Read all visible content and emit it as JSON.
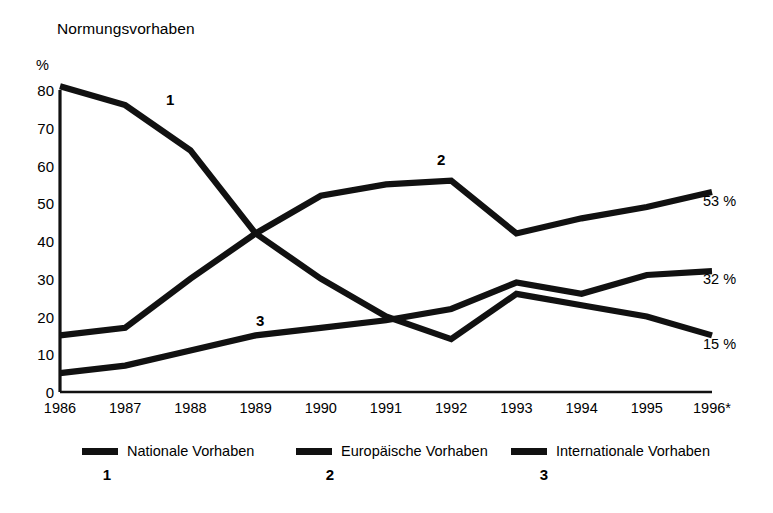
{
  "chart_data": {
    "type": "line",
    "title": "Normungsvorhaben",
    "xlabel": "",
    "ylabel": "%",
    "ylim": [
      0,
      80
    ],
    "yticks": [
      0,
      10,
      20,
      30,
      40,
      50,
      60,
      70,
      80
    ],
    "grid": false,
    "legend_position": "bottom",
    "categories": [
      "1986",
      "1987",
      "1988",
      "1989",
      "1990",
      "1991",
      "1992",
      "1993",
      "1994",
      "1995",
      "1996*"
    ],
    "series": [
      {
        "name": "Nationale Vorhaben",
        "key": "1",
        "values": [
          81,
          76,
          64,
          42,
          30,
          20,
          14,
          26,
          23,
          20,
          15
        ],
        "end_label": "15 %",
        "annotation": "1"
      },
      {
        "name": "Europäische Vorhaben",
        "key": "2",
        "values": [
          15,
          17,
          30,
          42,
          52,
          55,
          56,
          42,
          46,
          49,
          53
        ],
        "end_label": "53 %",
        "annotation": "2"
      },
      {
        "name": "Internationale Vorhaben",
        "key": "3",
        "values": [
          5,
          7,
          11,
          15,
          17,
          19,
          22,
          29,
          26,
          31,
          32
        ],
        "end_label": "32 %",
        "annotation": "3"
      }
    ],
    "annotations": [
      {
        "text": "1",
        "x": 166,
        "y": 92
      },
      {
        "text": "2",
        "x": 437,
        "y": 152
      },
      {
        "text": "3",
        "x": 256,
        "y": 313
      }
    ],
    "end_labels": [
      {
        "text": "53 %",
        "x": 703,
        "y": 194
      },
      {
        "text": "32 %",
        "x": 703,
        "y": 272
      },
      {
        "text": "15 %",
        "x": 703,
        "y": 337
      }
    ]
  },
  "legend": {
    "items": [
      {
        "label": "Nationale Vorhaben",
        "number": "1",
        "x": 82,
        "number_x": 107
      },
      {
        "label": "Europäische Vorhaben",
        "number": "2",
        "x": 296,
        "number_x": 330
      },
      {
        "label": "Internationale Vorhaben",
        "number": "3",
        "x": 511,
        "number_x": 544
      }
    ]
  },
  "colors": {
    "ink": "#111111",
    "background": "#ffffff"
  }
}
